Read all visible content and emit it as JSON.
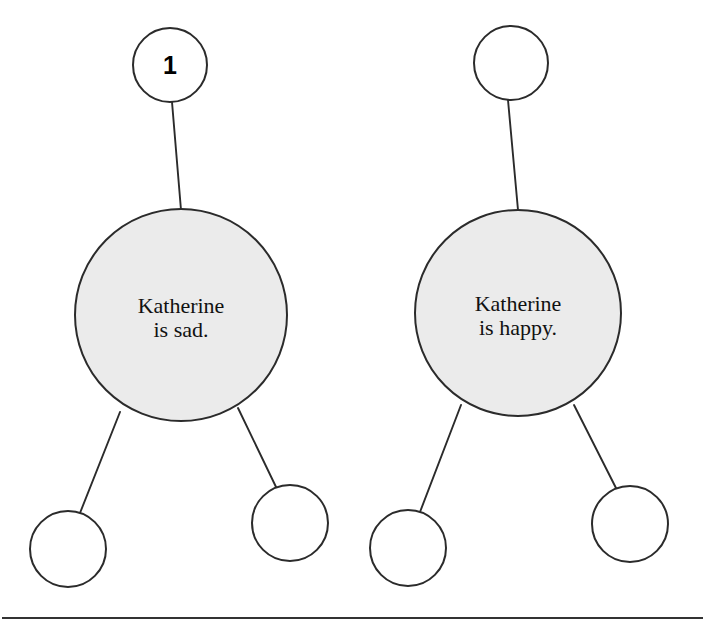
{
  "diagram": {
    "type": "tree-graph-pair",
    "background_color": "#ffffff",
    "node_fill_filled": "#ebebeb",
    "node_fill_empty": "#ffffff",
    "node_stroke_color": "#2b2b2b",
    "edge_stroke_color": "#2b2b2b",
    "text_color": "#111111",
    "trees": [
      {
        "id": "left-tree",
        "badge": {
          "label": "1",
          "cx": 170,
          "cy": 65,
          "r": 37,
          "filled": false
        },
        "root": {
          "id": "left-root",
          "line1": "Katherine",
          "line2": "is sad.",
          "cx": 181,
          "cy": 315,
          "r": 106,
          "filled": true
        },
        "children": [
          {
            "id": "left-child-1",
            "label": "",
            "cx": 68,
            "cy": 549,
            "r": 38,
            "filled": false
          },
          {
            "id": "left-child-2",
            "label": "",
            "cx": 290,
            "cy": 523,
            "r": 38,
            "filled": false
          }
        ]
      },
      {
        "id": "right-tree",
        "badge": {
          "label": "",
          "cx": 511,
          "cy": 63,
          "r": 37,
          "filled": false
        },
        "root": {
          "id": "right-root",
          "line1": "Katherine",
          "line2": "is happy.",
          "cx": 518,
          "cy": 313,
          "r": 103,
          "filled": true
        },
        "children": [
          {
            "id": "right-child-1",
            "label": "",
            "cx": 408,
            "cy": 548,
            "r": 38,
            "filled": false
          },
          {
            "id": "right-child-2",
            "label": "",
            "cx": 630,
            "cy": 524,
            "r": 38,
            "filled": false
          }
        ]
      }
    ],
    "footer_rule": {
      "y": 618,
      "x1": 2,
      "x2": 703
    }
  }
}
